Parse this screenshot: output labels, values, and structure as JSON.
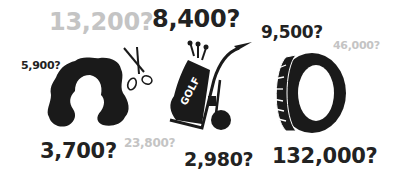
{
  "colors": {
    "dark_text": "#222222",
    "light_text": "#c4c4c4",
    "icon": "#1a1a1a",
    "background": "#ffffff"
  },
  "icons": [
    {
      "name": "wig-icon"
    },
    {
      "name": "scissors-icon"
    },
    {
      "name": "golf-cart-icon",
      "bag_text": "GOLF"
    },
    {
      "name": "tire-icon"
    }
  ],
  "labels": {
    "wig_top_gray": "13,200?",
    "wig_left": "5,900?",
    "wig_bottom": "3,700?",
    "golf_top": "8,400?",
    "golf_bottom_gray": "23,800?",
    "golf_bottom": "2,980?",
    "tire_top": "9,500?",
    "tire_top_gray": "46,000?",
    "tire_bottom": "132,000?"
  },
  "golf_bag_text": "GOLF"
}
